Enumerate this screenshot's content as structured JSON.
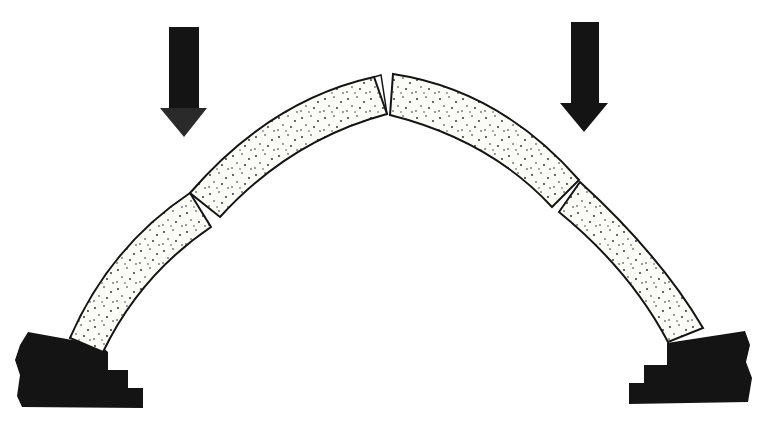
{
  "diagram": {
    "title": "",
    "colors": {
      "background": "#ffffff",
      "ink": "#141414",
      "stone_fill": "#fbfbf8",
      "stipple": "#222222"
    },
    "loads": [
      {
        "id": "left-load",
        "direction": "down"
      },
      {
        "id": "right-load",
        "direction": "down"
      }
    ],
    "voussoirs": [
      {
        "id": "left-lower"
      },
      {
        "id": "left-upper"
      },
      {
        "id": "right-upper"
      },
      {
        "id": "right-lower"
      }
    ],
    "abutments": [
      {
        "id": "left-abutment"
      },
      {
        "id": "right-abutment"
      }
    ]
  }
}
